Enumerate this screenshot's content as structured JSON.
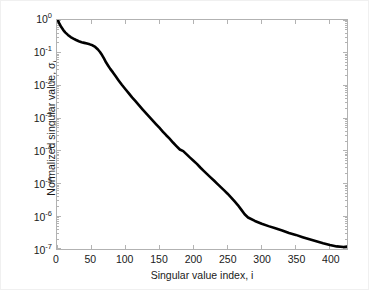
{
  "chart_data": {
    "type": "line",
    "title": "",
    "xlabel": "Singular value index, i",
    "ylabel_prefix": "Normalized singular value, σ",
    "ylabel_subscript": "i",
    "ylabel_full": "Normalized singular value, σi",
    "yscale": "log",
    "xscale": "linear",
    "xlim": [
      0,
      425
    ],
    "ylim": [
      1e-07,
      1
    ],
    "grid": false,
    "legend": null,
    "xticks": [
      0,
      50,
      100,
      150,
      200,
      250,
      300,
      350,
      400
    ],
    "xtick_labels": [
      "0",
      "50",
      "100",
      "150",
      "200",
      "250",
      "300",
      "350",
      "400"
    ],
    "yticks": [
      1,
      0.1,
      0.01,
      0.001,
      0.0001,
      1e-05,
      1e-06,
      1e-07
    ],
    "ytick_labels": [
      "10^0",
      "10^-1",
      "10^-2",
      "10^-3",
      "10^-4",
      "10^-5",
      "10^-6",
      "10^-7"
    ],
    "ytick_mantissa": [
      "10",
      "10",
      "10",
      "10",
      "10",
      "10",
      "10",
      "10"
    ],
    "ytick_exponents": [
      "0",
      "-1",
      "-2",
      "-3",
      "-4",
      "-5",
      "-6",
      "-7"
    ],
    "line_color": "#000000",
    "line_width": 2.6,
    "axes_color": "#b2b2b2",
    "background_color": "#ffffff",
    "text_color": "#1a1a1a",
    "series": [
      {
        "name": "Normalized singular values",
        "x": [
          1,
          3,
          6,
          9,
          12,
          16,
          20,
          24,
          28,
          32,
          36,
          40,
          44,
          48,
          52,
          56,
          60,
          63,
          66,
          69,
          72,
          75,
          78,
          82,
          86,
          90,
          95,
          100,
          105,
          110,
          115,
          120,
          125,
          130,
          135,
          140,
          145,
          150,
          155,
          160,
          165,
          170,
          175,
          180,
          185,
          190,
          195,
          200,
          205,
          210,
          215,
          220,
          225,
          230,
          235,
          240,
          245,
          250,
          255,
          260,
          265,
          270,
          275,
          280,
          290,
          300,
          310,
          320,
          330,
          340,
          350,
          360,
          370,
          380,
          390,
          400,
          410,
          420,
          425
        ],
        "values": [
          1.0,
          0.82,
          0.62,
          0.5,
          0.42,
          0.35,
          0.3,
          0.27,
          0.245,
          0.225,
          0.21,
          0.2,
          0.19,
          0.18,
          0.168,
          0.15,
          0.125,
          0.105,
          0.085,
          0.066,
          0.05,
          0.04,
          0.032,
          0.025,
          0.019,
          0.0145,
          0.0105,
          0.0078,
          0.0058,
          0.0043,
          0.0033,
          0.0025,
          0.0019,
          0.00145,
          0.00112,
          0.00086,
          0.00066,
          0.00051,
          0.00039,
          0.0003,
          0.000235,
          0.00018,
          0.00014,
          0.00011,
          9.8e-05,
          7.8e-05,
          6.2e-05,
          5e-05,
          4e-05,
          3.1e-05,
          2.45e-05,
          1.95e-05,
          1.55e-05,
          1.24e-05,
          9.8e-06,
          7.8e-06,
          6.2e-06,
          4.9e-06,
          3.8e-06,
          2.9e-06,
          2.2e-06,
          1.6e-06,
          1.15e-06,
          9.2e-07,
          7.2e-07,
          5.9e-07,
          5e-07,
          4.3e-07,
          3.7e-07,
          3.1e-07,
          2.7e-07,
          2.3e-07,
          1.98e-07,
          1.72e-07,
          1.5e-07,
          1.33e-07,
          1.2e-07,
          1.15e-07,
          1.18e-07
        ]
      }
    ],
    "annotations": []
  }
}
